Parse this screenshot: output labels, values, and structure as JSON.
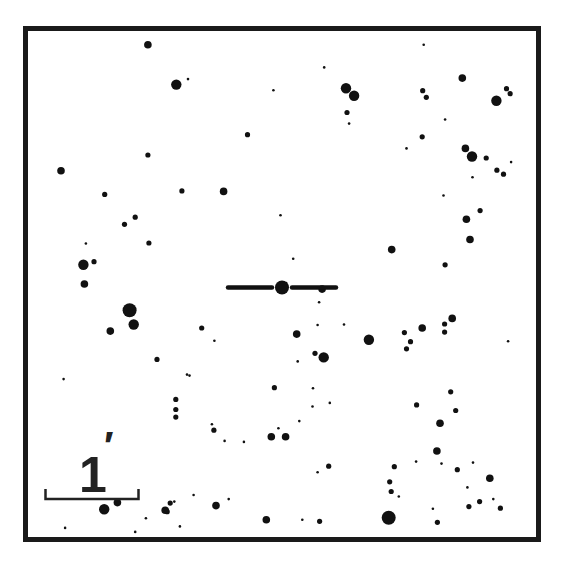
{
  "chart_data": {
    "type": "scatter",
    "title": "",
    "field_coordinates": "normalized 0-1 across the framed field, x to the right, y downward",
    "size_scale": "1 = faintest dot, 6 = brightest star",
    "scale_bar": {
      "label": "1",
      "unit_symbol": "′",
      "meaning": "1 arcminute"
    },
    "target": {
      "x": 0.5,
      "y": 0.507,
      "size": 5,
      "marker": "horizontal-ticks"
    },
    "stars": [
      {
        "x": 0.236,
        "y": 0.027,
        "s": 3
      },
      {
        "x": 0.292,
        "y": 0.106,
        "s": 4
      },
      {
        "x": 0.315,
        "y": 0.095,
        "s": 1
      },
      {
        "x": 0.483,
        "y": 0.117,
        "s": 1
      },
      {
        "x": 0.626,
        "y": 0.113,
        "s": 4
      },
      {
        "x": 0.642,
        "y": 0.128,
        "s": 4
      },
      {
        "x": 0.628,
        "y": 0.161,
        "s": 2
      },
      {
        "x": 0.632,
        "y": 0.183,
        "s": 1
      },
      {
        "x": 0.583,
        "y": 0.072,
        "s": 1
      },
      {
        "x": 0.779,
        "y": 0.027,
        "s": 1
      },
      {
        "x": 0.777,
        "y": 0.118,
        "s": 2
      },
      {
        "x": 0.784,
        "y": 0.131,
        "s": 2
      },
      {
        "x": 0.855,
        "y": 0.093,
        "s": 3
      },
      {
        "x": 0.922,
        "y": 0.138,
        "s": 4
      },
      {
        "x": 0.942,
        "y": 0.114,
        "s": 2
      },
      {
        "x": 0.949,
        "y": 0.124,
        "s": 2
      },
      {
        "x": 0.821,
        "y": 0.175,
        "s": 1
      },
      {
        "x": 0.776,
        "y": 0.209,
        "s": 2
      },
      {
        "x": 0.745,
        "y": 0.232,
        "s": 1
      },
      {
        "x": 0.432,
        "y": 0.205,
        "s": 2
      },
      {
        "x": 0.236,
        "y": 0.245,
        "s": 2
      },
      {
        "x": 0.065,
        "y": 0.276,
        "s": 3
      },
      {
        "x": 0.303,
        "y": 0.316,
        "s": 2
      },
      {
        "x": 0.151,
        "y": 0.323,
        "s": 2
      },
      {
        "x": 0.385,
        "y": 0.317,
        "s": 3
      },
      {
        "x": 0.861,
        "y": 0.232,
        "s": 3
      },
      {
        "x": 0.874,
        "y": 0.248,
        "s": 4
      },
      {
        "x": 0.902,
        "y": 0.251,
        "s": 2
      },
      {
        "x": 0.923,
        "y": 0.275,
        "s": 2
      },
      {
        "x": 0.936,
        "y": 0.283,
        "s": 2
      },
      {
        "x": 0.951,
        "y": 0.259,
        "s": 1
      },
      {
        "x": 0.875,
        "y": 0.289,
        "s": 1
      },
      {
        "x": 0.818,
        "y": 0.325,
        "s": 1
      },
      {
        "x": 0.89,
        "y": 0.355,
        "s": 2
      },
      {
        "x": 0.211,
        "y": 0.368,
        "s": 2
      },
      {
        "x": 0.19,
        "y": 0.382,
        "s": 2
      },
      {
        "x": 0.238,
        "y": 0.419,
        "s": 2
      },
      {
        "x": 0.497,
        "y": 0.364,
        "s": 1
      },
      {
        "x": 0.716,
        "y": 0.432,
        "s": 3
      },
      {
        "x": 0.863,
        "y": 0.372,
        "s": 3
      },
      {
        "x": 0.87,
        "y": 0.412,
        "s": 3
      },
      {
        "x": 0.821,
        "y": 0.462,
        "s": 2
      },
      {
        "x": 0.522,
        "y": 0.45,
        "s": 1
      },
      {
        "x": 0.508,
        "y": 0.498,
        "s": 1
      },
      {
        "x": 0.114,
        "y": 0.42,
        "s": 1
      },
      {
        "x": 0.109,
        "y": 0.462,
        "s": 4
      },
      {
        "x": 0.13,
        "y": 0.456,
        "s": 2
      },
      {
        "x": 0.111,
        "y": 0.5,
        "s": 3
      },
      {
        "x": 0.2,
        "y": 0.552,
        "s": 5
      },
      {
        "x": 0.208,
        "y": 0.58,
        "s": 4
      },
      {
        "x": 0.162,
        "y": 0.593,
        "s": 3
      },
      {
        "x": 0.254,
        "y": 0.649,
        "s": 2
      },
      {
        "x": 0.367,
        "y": 0.612,
        "s": 1
      },
      {
        "x": 0.342,
        "y": 0.587,
        "s": 2
      },
      {
        "x": 0.579,
        "y": 0.51,
        "s": 3
      },
      {
        "x": 0.573,
        "y": 0.536,
        "s": 1
      },
      {
        "x": 0.529,
        "y": 0.599,
        "s": 3
      },
      {
        "x": 0.57,
        "y": 0.581,
        "s": 1
      },
      {
        "x": 0.622,
        "y": 0.58,
        "s": 1
      },
      {
        "x": 0.671,
        "y": 0.61,
        "s": 4
      },
      {
        "x": 0.565,
        "y": 0.637,
        "s": 2
      },
      {
        "x": 0.582,
        "y": 0.645,
        "s": 4
      },
      {
        "x": 0.741,
        "y": 0.596,
        "s": 2
      },
      {
        "x": 0.776,
        "y": 0.587,
        "s": 3
      },
      {
        "x": 0.82,
        "y": 0.579,
        "s": 2
      },
      {
        "x": 0.835,
        "y": 0.568,
        "s": 3
      },
      {
        "x": 0.82,
        "y": 0.595,
        "s": 2
      },
      {
        "x": 0.945,
        "y": 0.613,
        "s": 1
      },
      {
        "x": 0.531,
        "y": 0.653,
        "s": 1
      },
      {
        "x": 0.318,
        "y": 0.681,
        "s": 1
      },
      {
        "x": 0.313,
        "y": 0.679,
        "s": 1
      },
      {
        "x": 0.07,
        "y": 0.688,
        "s": 1
      },
      {
        "x": 0.291,
        "y": 0.728,
        "s": 2
      },
      {
        "x": 0.291,
        "y": 0.748,
        "s": 2
      },
      {
        "x": 0.291,
        "y": 0.763,
        "s": 2
      },
      {
        "x": 0.362,
        "y": 0.777,
        "s": 1
      },
      {
        "x": 0.366,
        "y": 0.789,
        "s": 2
      },
      {
        "x": 0.387,
        "y": 0.81,
        "s": 1
      },
      {
        "x": 0.425,
        "y": 0.812,
        "s": 1
      },
      {
        "x": 0.485,
        "y": 0.705,
        "s": 2
      },
      {
        "x": 0.561,
        "y": 0.706,
        "s": 1
      },
      {
        "x": 0.745,
        "y": 0.628,
        "s": 2
      },
      {
        "x": 0.753,
        "y": 0.614,
        "s": 2
      },
      {
        "x": 0.832,
        "y": 0.713,
        "s": 2
      },
      {
        "x": 0.765,
        "y": 0.739,
        "s": 2
      },
      {
        "x": 0.842,
        "y": 0.75,
        "s": 2
      },
      {
        "x": 0.811,
        "y": 0.775,
        "s": 3
      },
      {
        "x": 0.56,
        "y": 0.742,
        "s": 1
      },
      {
        "x": 0.594,
        "y": 0.735,
        "s": 1
      },
      {
        "x": 0.534,
        "y": 0.771,
        "s": 1
      },
      {
        "x": 0.493,
        "y": 0.785,
        "s": 1
      },
      {
        "x": 0.479,
        "y": 0.802,
        "s": 3
      },
      {
        "x": 0.507,
        "y": 0.802,
        "s": 3
      },
      {
        "x": 0.57,
        "y": 0.872,
        "s": 1
      },
      {
        "x": 0.592,
        "y": 0.86,
        "s": 2
      },
      {
        "x": 0.721,
        "y": 0.861,
        "s": 2
      },
      {
        "x": 0.764,
        "y": 0.851,
        "s": 1
      },
      {
        "x": 0.712,
        "y": 0.891,
        "s": 2
      },
      {
        "x": 0.715,
        "y": 0.91,
        "s": 2
      },
      {
        "x": 0.73,
        "y": 0.92,
        "s": 1
      },
      {
        "x": 0.805,
        "y": 0.83,
        "s": 3
      },
      {
        "x": 0.814,
        "y": 0.855,
        "s": 1
      },
      {
        "x": 0.845,
        "y": 0.867,
        "s": 2
      },
      {
        "x": 0.876,
        "y": 0.853,
        "s": 1
      },
      {
        "x": 0.865,
        "y": 0.902,
        "s": 1
      },
      {
        "x": 0.868,
        "y": 0.94,
        "s": 2
      },
      {
        "x": 0.909,
        "y": 0.884,
        "s": 3
      },
      {
        "x": 0.889,
        "y": 0.93,
        "s": 2
      },
      {
        "x": 0.916,
        "y": 0.925,
        "s": 1
      },
      {
        "x": 0.93,
        "y": 0.943,
        "s": 2
      },
      {
        "x": 0.797,
        "y": 0.944,
        "s": 1
      },
      {
        "x": 0.806,
        "y": 0.971,
        "s": 2
      },
      {
        "x": 0.71,
        "y": 0.962,
        "s": 5
      },
      {
        "x": 0.469,
        "y": 0.966,
        "s": 3
      },
      {
        "x": 0.395,
        "y": 0.925,
        "s": 1
      },
      {
        "x": 0.37,
        "y": 0.938,
        "s": 3
      },
      {
        "x": 0.54,
        "y": 0.966,
        "s": 1
      },
      {
        "x": 0.574,
        "y": 0.969,
        "s": 2
      },
      {
        "x": 0.326,
        "y": 0.917,
        "s": 1
      },
      {
        "x": 0.274,
        "y": 0.95,
        "s": 2
      },
      {
        "x": 0.288,
        "y": 0.93,
        "s": 1
      },
      {
        "x": 0.176,
        "y": 0.932,
        "s": 3
      },
      {
        "x": 0.28,
        "y": 0.933,
        "s": 2
      },
      {
        "x": 0.232,
        "y": 0.963,
        "s": 1
      },
      {
        "x": 0.073,
        "y": 0.982,
        "s": 1
      },
      {
        "x": 0.211,
        "y": 0.99,
        "s": 1
      },
      {
        "x": 0.299,
        "y": 0.979,
        "s": 1
      },
      {
        "x": 0.27,
        "y": 0.947,
        "s": 3
      },
      {
        "x": 0.15,
        "y": 0.945,
        "s": 4
      }
    ]
  }
}
